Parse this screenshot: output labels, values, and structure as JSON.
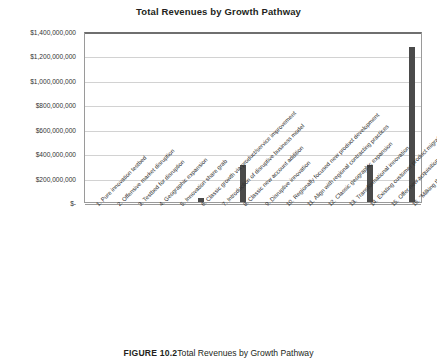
{
  "chart_data": {
    "type": "bar",
    "title": "Total Revenues by Growth Pathway",
    "xlabel": "",
    "ylabel": "",
    "ylim": [
      0,
      1400000000
    ],
    "grid": true,
    "legend": "none",
    "ytick_labels": [
      "$1,400,000,000",
      "$1,200,000,000",
      "$1,000,000,000",
      "$800,000,000",
      "$600,000,000",
      "$400,000,000",
      "$200,000,000",
      "$-"
    ],
    "ytick_values": [
      1400000000,
      1200000000,
      1000000000,
      800000000,
      600000000,
      400000000,
      200000000,
      0
    ],
    "categories": [
      "1. Pure innovation testbed",
      "2. Offensive market disruption",
      "3. Testbed for disruption",
      "4. Geographic expansion",
      "5. Innovation share grab",
      "6. Classic growth via product/service improvement",
      "7. Introduction of disruptive business model",
      "8. Classic new account addition",
      "9. Disruptive innovation",
      "10. Regionally focused new product development",
      "11. Align with regional contracting practices",
      "12. Classic geographic expansion",
      "13. Transformational innovation",
      "14. Existing customer product migration",
      "15. Offer new acquisition models",
      "16. \"Milking the cow\""
    ],
    "values": [
      0,
      0,
      0,
      0,
      0,
      30000000,
      0,
      300000000,
      0,
      0,
      0,
      0,
      0,
      300000000,
      0,
      1270000000
    ],
    "bar_color": "#4a4a4a"
  },
  "caption": {
    "label": "FIGURE 10.2",
    "text": "Total Revenues by Growth Pathway"
  },
  "colors": {
    "bar": "#4a4a4a",
    "grid": "#d2d2d2",
    "axis": "#9a9a9a",
    "text": "#231f20"
  }
}
